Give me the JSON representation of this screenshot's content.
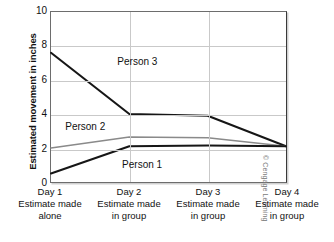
{
  "chart_data": {
    "type": "line",
    "title": "",
    "xlabel": "",
    "ylabel": "Estimated movement in inches",
    "ylim": [
      0,
      10
    ],
    "yticks": [
      0,
      2,
      4,
      6,
      8,
      10
    ],
    "ytick_labels": [
      "0",
      "2",
      "4",
      "6",
      "8",
      "10"
    ],
    "grid": "both",
    "legend": "inline-labels",
    "categories": [
      "Day 1",
      "Day 2",
      "Day 3",
      "Day 4"
    ],
    "category_descriptions": [
      "Estimate made alone",
      "Estimate made in group",
      "Estimate made in group",
      "Estimate made in group"
    ],
    "x_tick_lines": [
      {
        "day": "Day 1",
        "line1": "Estimate made",
        "line2": "alone"
      },
      {
        "day": "Day 2",
        "line1": "Estimate made",
        "line2": "in group"
      },
      {
        "day": "Day 3",
        "line1": "Estimate made",
        "line2": "in group"
      },
      {
        "day": "Day 4",
        "line1": "Estimate made",
        "line2": "in group"
      }
    ],
    "series": [
      {
        "name": "Person 3",
        "values": [
          7.6,
          4.0,
          3.9,
          2.1
        ],
        "color": "#161616",
        "label_x": 0.28,
        "label_y": 7.1
      },
      {
        "name": "Person 2",
        "values": [
          2.0,
          2.65,
          2.6,
          2.1
        ],
        "color": "#8a8a8a",
        "label_x": 0.06,
        "label_y": 3.3
      },
      {
        "name": "Person 1",
        "values": [
          0.5,
          2.1,
          2.15,
          2.1
        ],
        "color": "#161616",
        "label_x": 0.3,
        "label_y": 1.1
      }
    ]
  },
  "credit": "© Cengage Learning"
}
